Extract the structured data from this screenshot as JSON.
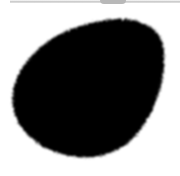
{
  "canvas": {
    "description": "Brush stroke preview",
    "background_color": "#ffffff",
    "blob_color": "#000000",
    "edge_color": "#c8c8c8"
  }
}
